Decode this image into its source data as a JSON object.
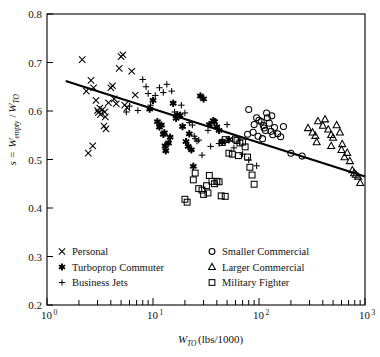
{
  "chart_data": {
    "type": "scatter",
    "title": "",
    "xlabel": "W_TO (lbs/1000)",
    "xlabel_parts": {
      "main": "W",
      "sub": "TO",
      "unit": " (lbs/1000)"
    },
    "ylabel": "s = W_empty/W_TO",
    "ylabel_parts": {
      "lead": "s = ",
      "w1": "W",
      "sub1": "empty",
      "slash": "/",
      "w2": "W",
      "sub2": "TO"
    },
    "xscale": "log",
    "yscale": "linear",
    "xlim": [
      1,
      1000
    ],
    "ylim": [
      0.2,
      0.8
    ],
    "grid": false,
    "yticks": [
      0.2,
      0.3,
      0.4,
      0.5,
      0.6,
      0.7,
      0.8
    ],
    "ytick_labels": [
      "0.2",
      "0.3",
      "0.4",
      "0.5",
      "0.6",
      "0.7",
      "0.8"
    ],
    "xticks": [
      1,
      10,
      100,
      1000
    ],
    "xtick_labels": [
      "10^0",
      "10^1",
      "10^2",
      "10^3"
    ],
    "xtick_label_parts": [
      {
        "base": "10",
        "exp": "0"
      },
      {
        "base": "10",
        "exp": "1"
      },
      {
        "base": "10",
        "exp": "2"
      },
      {
        "base": "10",
        "exp": "3"
      }
    ],
    "legend_position": "lower-left-inside",
    "trendline": {
      "label": "",
      "x": [
        1.5,
        1000
      ],
      "y": [
        0.662,
        0.465
      ],
      "color": "#000000"
    },
    "series": [
      {
        "name": "Personal",
        "marker": "x",
        "color": "#000000",
        "points": [
          [
            2.15,
            0.706
          ],
          [
            2.6,
            0.663
          ],
          [
            2.75,
            0.648
          ],
          [
            2.9,
            0.622
          ],
          [
            3.0,
            0.601
          ],
          [
            3.05,
            0.597
          ],
          [
            3.15,
            0.606
          ],
          [
            3.2,
            0.593
          ],
          [
            3.35,
            0.603
          ],
          [
            3.5,
            0.598
          ],
          [
            3.55,
            0.588
          ],
          [
            2.45,
            0.513
          ],
          [
            2.7,
            0.528
          ],
          [
            4.0,
            0.648
          ],
          [
            4.15,
            0.652
          ],
          [
            4.3,
            0.625
          ],
          [
            4.5,
            0.615
          ],
          [
            4.8,
            0.688
          ],
          [
            5.0,
            0.712
          ],
          [
            5.2,
            0.716
          ],
          [
            5.4,
            0.612
          ],
          [
            6.3,
            0.682
          ],
          [
            6.8,
            0.633
          ],
          [
            3.8,
            0.617
          ],
          [
            3.45,
            0.569
          ],
          [
            3.6,
            0.563
          ],
          [
            5.7,
            0.607
          ],
          [
            2.35,
            0.641
          ]
        ]
      },
      {
        "name": "Turboprop Commuter",
        "marker": "star",
        "color": "#000000",
        "points": [
          [
            10.0,
            0.622
          ],
          [
            11.0,
            0.578
          ],
          [
            11.5,
            0.567
          ],
          [
            12.0,
            0.571
          ],
          [
            12.5,
            0.552
          ],
          [
            12.8,
            0.555
          ],
          [
            13.0,
            0.528
          ],
          [
            13.2,
            0.518
          ],
          [
            14.0,
            0.534
          ],
          [
            14.5,
            0.546
          ],
          [
            15.5,
            0.616
          ],
          [
            16.5,
            0.585
          ],
          [
            17.0,
            0.592
          ],
          [
            18.0,
            0.591
          ],
          [
            19.0,
            0.568
          ],
          [
            20.5,
            0.537
          ],
          [
            21.5,
            0.527
          ],
          [
            22.0,
            0.553
          ],
          [
            23.0,
            0.52
          ],
          [
            24.0,
            0.486
          ],
          [
            28.0,
            0.631
          ],
          [
            30.0,
            0.625
          ],
          [
            34.0,
            0.572
          ],
          [
            37.0,
            0.58
          ],
          [
            38.0,
            0.578
          ],
          [
            40.0,
            0.567
          ],
          [
            42.0,
            0.56
          ],
          [
            45.0,
            0.536
          ],
          [
            52.0,
            0.541
          ],
          [
            9.3,
            0.604
          ]
        ]
      },
      {
        "name": "Business Jets",
        "marker": "plus",
        "color": "#000000",
        "points": [
          [
            8.0,
            0.665
          ],
          [
            8.6,
            0.65
          ],
          [
            9.0,
            0.636
          ],
          [
            9.5,
            0.612
          ],
          [
            10.5,
            0.632
          ],
          [
            11.5,
            0.648
          ],
          [
            12.5,
            0.638
          ],
          [
            13.5,
            0.655
          ],
          [
            15.0,
            0.641
          ],
          [
            16.0,
            0.598
          ],
          [
            18.5,
            0.612
          ],
          [
            20.0,
            0.596
          ],
          [
            22.0,
            0.576
          ],
          [
            23.5,
            0.571
          ],
          [
            24.5,
            0.548
          ],
          [
            25.0,
            0.543
          ],
          [
            26.0,
            0.538
          ],
          [
            27.0,
            0.54
          ],
          [
            29.0,
            0.509
          ],
          [
            33.0,
            0.56
          ],
          [
            35.0,
            0.527
          ],
          [
            42.0,
            0.533
          ],
          [
            50.0,
            0.572
          ],
          [
            58.0,
            0.524
          ],
          [
            70.0,
            0.511
          ],
          [
            80.0,
            0.499
          ],
          [
            95.0,
            0.487
          ],
          [
            7.2,
            0.601
          ],
          [
            6.0,
            0.61
          ],
          [
            5.6,
            0.598
          ]
        ]
      },
      {
        "name": "Smaller Commercial",
        "marker": "circle",
        "color": "#000000",
        "points": [
          [
            80.0,
            0.603
          ],
          [
            90.0,
            0.572
          ],
          [
            95.0,
            0.586
          ],
          [
            100.0,
            0.581
          ],
          [
            105.0,
            0.578
          ],
          [
            110.0,
            0.57
          ],
          [
            112.0,
            0.565
          ],
          [
            115.0,
            0.56
          ],
          [
            120.0,
            0.586
          ],
          [
            125.0,
            0.575
          ],
          [
            130.0,
            0.558
          ],
          [
            135.0,
            0.551
          ],
          [
            140.0,
            0.566
          ],
          [
            150.0,
            0.553
          ],
          [
            160.0,
            0.547
          ],
          [
            170.0,
            0.568
          ],
          [
            98.0,
            0.548
          ],
          [
            108.0,
            0.543
          ],
          [
            78.0,
            0.552
          ],
          [
            88.0,
            0.556
          ],
          [
            200.0,
            0.513
          ],
          [
            255.0,
            0.507
          ],
          [
            118.0,
            0.596
          ],
          [
            132.0,
            0.59
          ]
        ]
      },
      {
        "name": "Larger Commercial",
        "marker": "triangle",
        "color": "#000000",
        "points": [
          [
            290.0,
            0.565
          ],
          [
            320.0,
            0.556
          ],
          [
            340.0,
            0.549
          ],
          [
            360.0,
            0.579
          ],
          [
            400.0,
            0.57
          ],
          [
            420.0,
            0.583
          ],
          [
            450.0,
            0.562
          ],
          [
            480.0,
            0.551
          ],
          [
            500.0,
            0.545
          ],
          [
            540.0,
            0.571
          ],
          [
            580.0,
            0.556
          ],
          [
            600.0,
            0.52
          ],
          [
            640.0,
            0.505
          ],
          [
            680.0,
            0.514
          ],
          [
            720.0,
            0.497
          ],
          [
            760.0,
            0.478
          ],
          [
            790.0,
            0.472
          ],
          [
            820.0,
            0.469
          ],
          [
            860.0,
            0.465
          ],
          [
            900.0,
            0.452
          ],
          [
            610.0,
            0.532
          ],
          [
            350.0,
            0.536
          ],
          [
            480.0,
            0.528
          ]
        ]
      },
      {
        "name": "Military Fighter",
        "marker": "square",
        "color": "#000000",
        "points": [
          [
            20.0,
            0.418
          ],
          [
            21.0,
            0.412
          ],
          [
            24.0,
            0.458
          ],
          [
            27.0,
            0.44
          ],
          [
            29.0,
            0.437
          ],
          [
            30.0,
            0.428
          ],
          [
            32.0,
            0.446
          ],
          [
            33.0,
            0.431
          ],
          [
            36.0,
            0.455
          ],
          [
            38.0,
            0.45
          ],
          [
            40.0,
            0.455
          ],
          [
            42.0,
            0.454
          ],
          [
            25.0,
            0.472
          ],
          [
            34.0,
            0.467
          ],
          [
            44.0,
            0.425
          ],
          [
            48.0,
            0.424
          ],
          [
            52.0,
            0.513
          ],
          [
            56.0,
            0.511
          ],
          [
            60.0,
            0.542
          ],
          [
            62.0,
            0.539
          ],
          [
            66.0,
            0.534
          ],
          [
            70.0,
            0.536
          ],
          [
            74.0,
            0.526
          ],
          [
            78.0,
            0.505
          ],
          [
            82.0,
            0.484
          ],
          [
            86.0,
            0.468
          ],
          [
            90.0,
            0.449
          ],
          [
            45.0,
            0.535
          ],
          [
            48.0,
            0.541
          ],
          [
            64.0,
            0.508
          ]
        ]
      }
    ]
  },
  "legend": {
    "entries": [
      {
        "label": "Personal",
        "marker": "x"
      },
      {
        "label": "Turboprop Commuter",
        "marker": "star"
      },
      {
        "label": "Business Jets",
        "marker": "plus"
      },
      {
        "label": "Smaller Commercial",
        "marker": "circle"
      },
      {
        "label": "Larger Commercial",
        "marker": "triangle"
      },
      {
        "label": "Military Fighter",
        "marker": "square"
      }
    ]
  }
}
